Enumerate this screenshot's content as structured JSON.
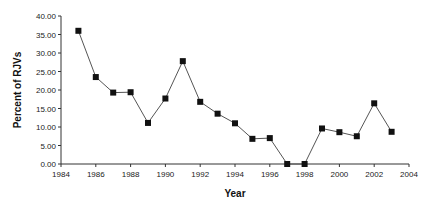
{
  "chart_data": {
    "type": "line",
    "title": "",
    "xlabel": "Year",
    "ylabel": "Percent of RJVs",
    "xlim": [
      1984,
      2004
    ],
    "ylim": [
      0,
      40
    ],
    "x_ticks": [
      "1984",
      "1986",
      "1988",
      "1990",
      "1992",
      "1994",
      "1996",
      "1998",
      "2000",
      "2002",
      "2004"
    ],
    "y_ticks": [
      "0.00",
      "5.00",
      "10.00",
      "15.00",
      "20.00",
      "25.00",
      "30.00",
      "35.00",
      "40.00"
    ],
    "grid": false,
    "legend": null,
    "marker": "square",
    "series": [
      {
        "name": "Percent of RJVs",
        "x": [
          1985,
          1986,
          1987,
          1988,
          1989,
          1990,
          1991,
          1992,
          1993,
          1994,
          1995,
          1996,
          1997,
          1998,
          1999,
          2000,
          2001,
          2002,
          2003
        ],
        "values": [
          36.0,
          23.5,
          19.3,
          19.4,
          11.1,
          17.7,
          27.8,
          16.8,
          13.6,
          11.0,
          6.8,
          7.0,
          0.0,
          0.0,
          9.6,
          8.6,
          7.5,
          16.4,
          8.7
        ]
      }
    ]
  },
  "colors": {
    "line": "#555555",
    "marker": "#111111",
    "axis": "#333333"
  }
}
